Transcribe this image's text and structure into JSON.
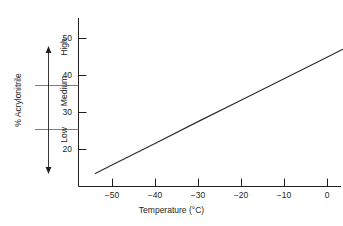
{
  "chart_data": {
    "type": "line",
    "title": "",
    "subtitle": "",
    "xlabel": "Temperature (°C)",
    "ylabel": "% Acrylonitrile",
    "xlim": [
      -58,
      7
    ],
    "ylim": [
      12,
      52
    ],
    "xticks": [
      -50,
      -40,
      -30,
      -20,
      -10,
      0
    ],
    "xtick_labels": [
      "−50",
      "−40",
      "−30",
      "−20",
      "−10",
      "0"
    ],
    "yticks": [
      20,
      30,
      40,
      50
    ],
    "ytick_labels": [
      "20",
      "30",
      "40",
      "50"
    ],
    "grid": false,
    "legend": null,
    "series": [
      {
        "name": "Glass transition / acrylonitrile content relation",
        "x": [
          -54,
          -50,
          -40,
          -30,
          -20,
          -10,
          0,
          6
        ],
        "y": [
          13.5,
          15.9,
          21.7,
          27.6,
          33.4,
          39.2,
          45.0,
          48.5
        ]
      }
    ],
    "annotations": [
      {
        "label": "High",
        "y_range": [
          35,
          48
        ],
        "kind": "band"
      },
      {
        "label": "Medium",
        "y_range": [
          25,
          35
        ],
        "kind": "band"
      },
      {
        "label": "Low",
        "y_range": [
          15,
          25
        ],
        "kind": "band"
      }
    ],
    "band_dividers": [
      35,
      25
    ],
    "arrow": {
      "kind": "double-headed-vertical",
      "from_y": 15,
      "to_y": 48
    }
  },
  "axes": {
    "y_title": "% Acrylonitrile",
    "x_title": "Temperature (°C)",
    "y_ticks": [
      "50",
      "40",
      "30",
      "20"
    ],
    "x_ticks": [
      "−50",
      "−40",
      "−30",
      "−20",
      "−10",
      "0"
    ]
  },
  "bands": {
    "high_label": "High",
    "medium_label": "Medium",
    "low_label": "Low"
  },
  "style": {
    "background": "#ffffff",
    "ink": "#231f20",
    "data_line": "#2b2b2b",
    "rule": "#6f6f6f"
  }
}
